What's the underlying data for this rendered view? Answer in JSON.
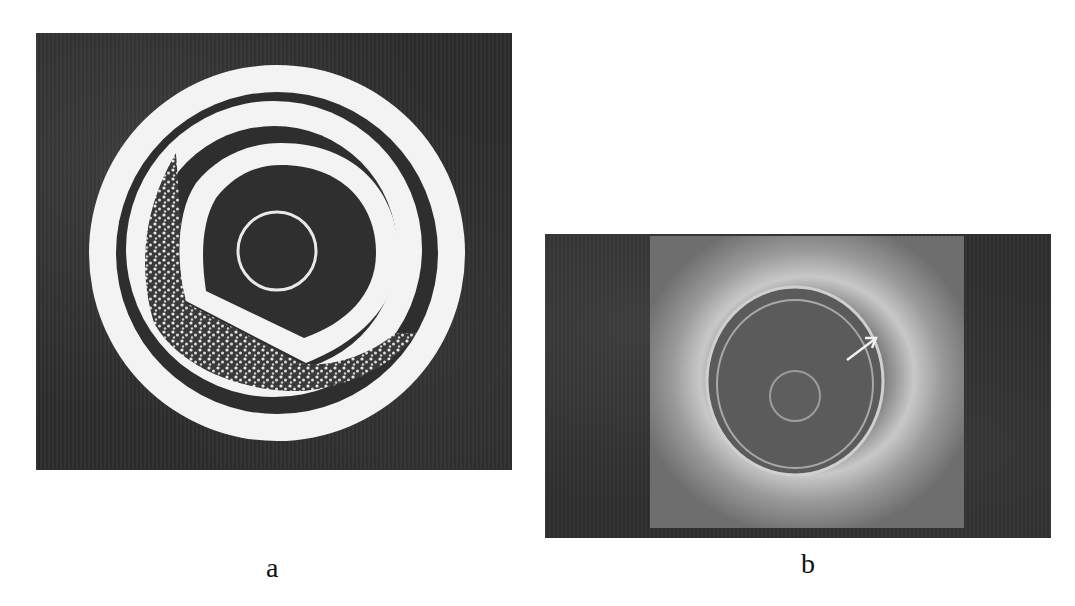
{
  "figure": {
    "panels": [
      {
        "label": "a",
        "description": "Simulated phantom cross-section: concentric white rings on dark background with speckled plaque region and thin inner catheter circle"
      },
      {
        "label": "b",
        "description": "Intravascular ultrasound image with lumen, vessel wall rings, catheter circle and white arrow annotation",
        "annotation": "arrow-icon"
      }
    ]
  },
  "colors": {
    "background": "#ffffff",
    "panel_dark": "#2c2c2c",
    "ring_white": "#f2f2f2",
    "ivus_gray": "#6a6a6a"
  }
}
